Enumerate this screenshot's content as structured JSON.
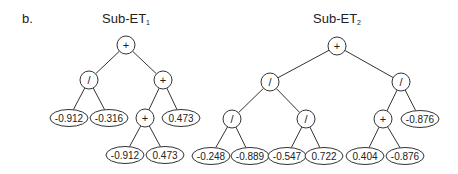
{
  "panel_label": "b.",
  "trees": [
    {
      "title": "Sub-ET",
      "subscript": "1",
      "title_x": 126,
      "nodes": [
        {
          "id": "r",
          "type": "op",
          "label": "+",
          "x": 126,
          "y": 45
        },
        {
          "id": "a",
          "type": "op",
          "label": "/",
          "x": 89,
          "y": 80,
          "parent": "r"
        },
        {
          "id": "b",
          "type": "op",
          "label": "+",
          "x": 163,
          "y": 80,
          "parent": "r"
        },
        {
          "id": "a1",
          "type": "leaf",
          "label": "-0.912",
          "x": 69,
          "y": 118,
          "parent": "a"
        },
        {
          "id": "a2",
          "type": "leaf",
          "label": "-0.316",
          "x": 109,
          "y": 118,
          "parent": "a"
        },
        {
          "id": "b1",
          "type": "op",
          "label": "+",
          "x": 145,
          "y": 118,
          "parent": "b"
        },
        {
          "id": "b2",
          "type": "leaf",
          "label": "0.473",
          "x": 181,
          "y": 118,
          "parent": "b"
        },
        {
          "id": "b11",
          "type": "leaf",
          "label": "-0.912",
          "x": 125,
          "y": 155,
          "parent": "b1"
        },
        {
          "id": "b12",
          "type": "leaf",
          "label": "0.473",
          "x": 165,
          "y": 155,
          "parent": "b1"
        }
      ]
    },
    {
      "title": "Sub-ET",
      "subscript": "2",
      "title_x": 337,
      "nodes": [
        {
          "id": "r",
          "type": "op",
          "label": "+",
          "x": 337,
          "y": 46
        },
        {
          "id": "a",
          "type": "op",
          "label": "/",
          "x": 270,
          "y": 82,
          "parent": "r"
        },
        {
          "id": "b",
          "type": "op",
          "label": "/",
          "x": 401,
          "y": 82,
          "parent": "r"
        },
        {
          "id": "a1",
          "type": "op",
          "label": "/",
          "x": 232,
          "y": 119,
          "parent": "a"
        },
        {
          "id": "a2",
          "type": "op",
          "label": "/",
          "x": 306,
          "y": 119,
          "parent": "a"
        },
        {
          "id": "b1",
          "type": "op",
          "label": "+",
          "x": 383,
          "y": 119,
          "parent": "b"
        },
        {
          "id": "b2",
          "type": "leaf",
          "label": "-0.876",
          "x": 420,
          "y": 119,
          "parent": "b"
        },
        {
          "id": "a11",
          "type": "leaf",
          "label": "-0.248",
          "x": 211,
          "y": 156,
          "parent": "a1"
        },
        {
          "id": "a12",
          "type": "leaf",
          "label": "-0.889",
          "x": 250,
          "y": 156,
          "parent": "a1"
        },
        {
          "id": "a21",
          "type": "leaf",
          "label": "-0.547",
          "x": 287,
          "y": 156,
          "parent": "a2"
        },
        {
          "id": "a22",
          "type": "leaf",
          "label": "0.722",
          "x": 324,
          "y": 156,
          "parent": "a2"
        },
        {
          "id": "b11",
          "type": "leaf",
          "label": "0.404",
          "x": 365,
          "y": 156,
          "parent": "b1"
        },
        {
          "id": "b12",
          "type": "leaf",
          "label": "-0.876",
          "x": 405,
          "y": 156,
          "parent": "b1"
        }
      ]
    }
  ],
  "colors": {
    "stroke": "#333333",
    "text": "#222222",
    "background": "#ffffff"
  }
}
